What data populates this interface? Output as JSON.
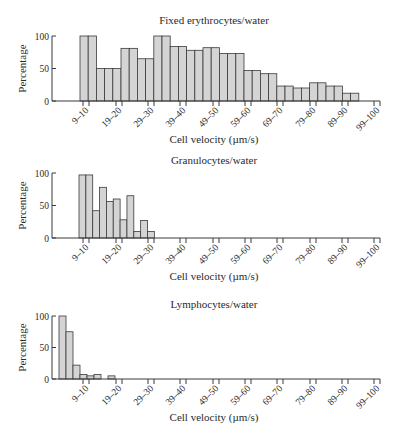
{
  "chart_data": [
    {
      "type": "bar",
      "title": "Fixed erythrocytes/water",
      "xlabel": "Cell velocity (µm/s)",
      "ylabel": "Percentage",
      "ylim": [
        0,
        100
      ],
      "yticks": [
        0,
        50,
        100
      ],
      "xtick_labels": [
        "9–10",
        "19–20",
        "29–30",
        "39–40",
        "49–50",
        "59–60",
        "69–70",
        "79–80",
        "89–90",
        "99–100"
      ],
      "bin_width_um_s": 3.33,
      "values": [
        100,
        100,
        50,
        50,
        50,
        81,
        81,
        65,
        65,
        100,
        100,
        84,
        84,
        78,
        78,
        82,
        82,
        73,
        73,
        73,
        47,
        47,
        42,
        42,
        23,
        23,
        20,
        20,
        28,
        28,
        23,
        23,
        12,
        12
      ],
      "grid": false
    },
    {
      "type": "bar",
      "title": "Granulocytes/water",
      "xlabel": "Cell velocity (µm/s)",
      "ylabel": "Percentage",
      "ylim": [
        0,
        100
      ],
      "yticks": [
        0,
        50,
        100
      ],
      "xtick_labels": [
        "9–10",
        "19–20",
        "29–30",
        "39–40",
        "49–50",
        "59–60",
        "69–70",
        "79–80",
        "89–90",
        "99–100"
      ],
      "values": [
        97,
        97,
        42,
        78,
        56,
        60,
        28,
        65,
        10,
        27,
        10
      ],
      "grid": false
    },
    {
      "type": "bar",
      "title": "Lymphocytes/water",
      "xlabel": "Cell velocity (µm/s)",
      "ylabel": "Percentage",
      "ylim": [
        0,
        100
      ],
      "yticks": [
        0,
        50,
        100
      ],
      "xtick_labels": [
        "9–10",
        "19–20",
        "29–30",
        "39–40",
        "49–50",
        "59–60",
        "69–70",
        "79–80",
        "89–90",
        "99–100"
      ],
      "values": [
        100,
        75,
        22,
        7,
        5,
        7,
        0,
        5
      ],
      "grid": false
    }
  ],
  "style": {
    "bar_fill": "#d4d4d4",
    "bar_stroke": "#3a3a3a",
    "axis_color": "#3a3a3a"
  }
}
